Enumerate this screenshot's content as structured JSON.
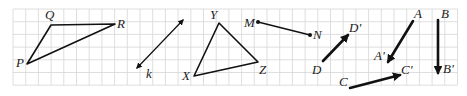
{
  "diagram": {
    "grid": {
      "x0": 13,
      "y0": 9,
      "cell": 12.7,
      "cols": 35,
      "rows": 6,
      "color": "#d6d6d6"
    },
    "triangle_pqr": {
      "vertices": [
        {
          "label": "P",
          "x": 27,
          "y": 64,
          "lx": 16,
          "ly": 67
        },
        {
          "label": "Q",
          "x": 51,
          "y": 25,
          "lx": 45,
          "ly": 19
        },
        {
          "label": "R",
          "x": 115,
          "y": 24,
          "lx": 117,
          "ly": 28
        }
      ]
    },
    "line_k": {
      "label": "k",
      "x1": 137,
      "y1": 68,
      "x2": 183,
      "y2": 20,
      "lx": 146,
      "ly": 78
    },
    "triangle_xyz": {
      "vertices": [
        {
          "label": "X",
          "x": 194,
          "y": 76,
          "lx": 182,
          "ly": 80
        },
        {
          "label": "Y",
          "x": 219,
          "y": 23,
          "lx": 210,
          "ly": 19
        },
        {
          "label": "Z",
          "x": 258,
          "y": 62,
          "lx": 259,
          "ly": 74
        }
      ]
    },
    "segment_mn": {
      "start": {
        "label": "M",
        "x": 258,
        "y": 22,
        "lx": 244,
        "ly": 27
      },
      "end": {
        "label": "N",
        "x": 310,
        "y": 35,
        "lx": 313,
        "ly": 39
      }
    },
    "vectors": [
      {
        "name": "DD'",
        "start": {
          "label": "D",
          "x": 323,
          "y": 61,
          "lx": 312,
          "ly": 74
        },
        "end": {
          "label": "D'",
          "x": 348,
          "y": 35,
          "lx": 349,
          "ly": 32
        }
      },
      {
        "name": "AA'",
        "start": {
          "label": "A",
          "x": 413,
          "y": 21,
          "lx": 414,
          "ly": 18
        },
        "end": {
          "label": "A'",
          "x": 388,
          "y": 62,
          "lx": 374,
          "ly": 60
        }
      },
      {
        "name": "CC'",
        "start": {
          "label": "C",
          "x": 350,
          "y": 88,
          "lx": 339,
          "ly": 86
        },
        "end": {
          "label": "C'",
          "x": 400,
          "y": 75,
          "lx": 401,
          "ly": 74
        }
      },
      {
        "name": "BB'",
        "start": {
          "label": "B",
          "x": 438,
          "y": 20,
          "lx": 441,
          "ly": 18
        },
        "end": {
          "label": "B'",
          "x": 438,
          "y": 73,
          "lx": 443,
          "ly": 73
        }
      }
    ]
  }
}
